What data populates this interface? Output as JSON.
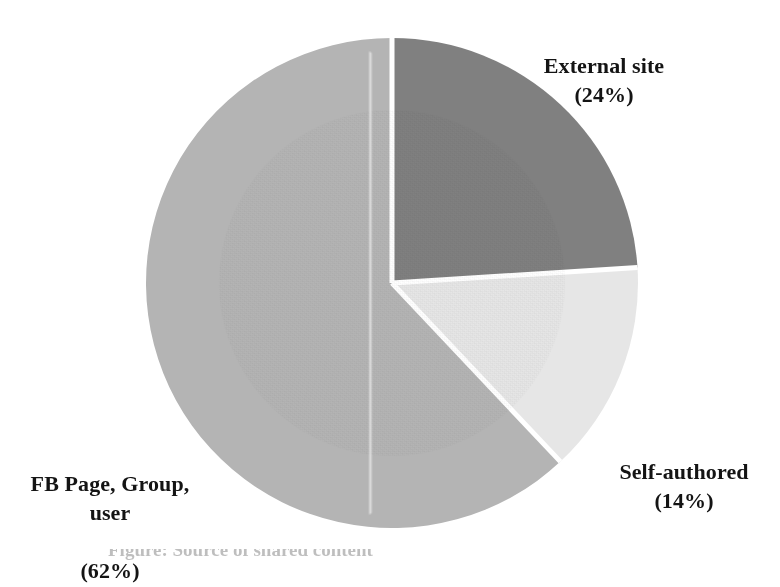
{
  "chart_data": {
    "type": "pie",
    "title": "",
    "subtitle": "",
    "xlabel": "",
    "ylabel": "",
    "legend_position": "none",
    "grid": false,
    "units": "percent",
    "start_angle_deg": 0,
    "direction": "clockwise",
    "categories": [
      "External site",
      "Self-authored",
      "FB Page, Group, user"
    ],
    "values": [
      24,
      14,
      62
    ],
    "slices": [
      {
        "label": "External site",
        "value": 24,
        "value_text": "(24%)",
        "color": "#808080",
        "start_deg": 0,
        "end_deg": 86.4,
        "label_position": "outside-top-right"
      },
      {
        "label": "Self-authored",
        "value": 14,
        "value_text": "(14%)",
        "color": "#e6e6e6",
        "start_deg": 86.4,
        "end_deg": 136.8,
        "label_position": "outside-bottom-right"
      },
      {
        "label": "FB Page, Group, user",
        "value": 62,
        "value_text": "(62%)",
        "color": "#b4b4b4",
        "start_deg": 136.8,
        "end_deg": 360,
        "label_position": "outside-bottom-left"
      }
    ]
  },
  "labels": {
    "external": {
      "name": "External site",
      "percent": "(24%)"
    },
    "self_authored": {
      "name": "Self-authored",
      "percent": "(14%)"
    },
    "fb": {
      "line1": "FB Page, Group,",
      "line2": "user",
      "percent": "(62%)"
    }
  },
  "caption": {
    "remnant": "Figure: Source of shared content"
  },
  "style": {
    "background": "#ffffff",
    "slice_divider": "#ffffff",
    "text_color": "#141414"
  }
}
